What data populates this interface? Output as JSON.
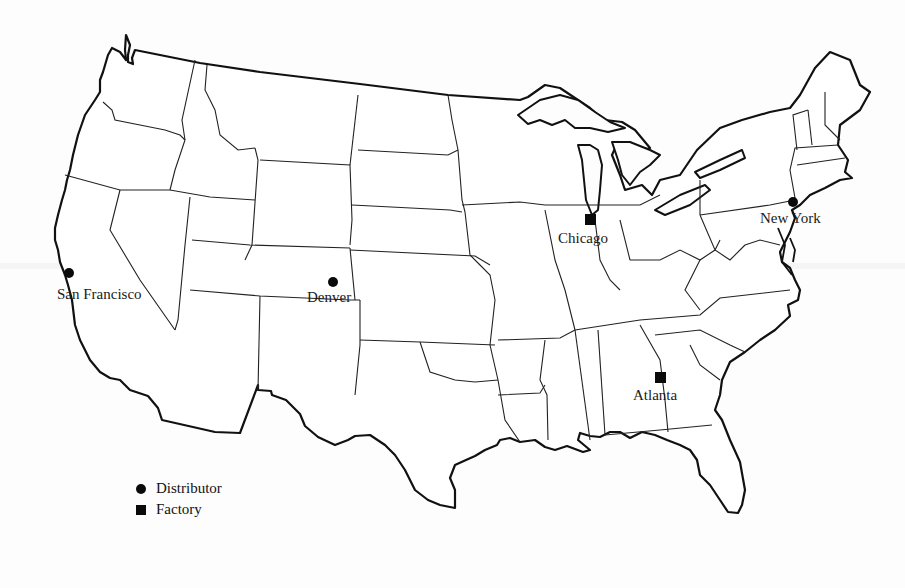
{
  "map": {
    "title": "United States distribution network",
    "region": "Contiguous United States (state outlines)"
  },
  "cities": [
    {
      "name": "San Francisco",
      "type": "distributor",
      "symbol": "circle",
      "x": 68,
      "y": 272
    },
    {
      "name": "Denver",
      "type": "distributor",
      "symbol": "circle",
      "x": 333,
      "y": 281
    },
    {
      "name": "Chicago",
      "type": "factory",
      "symbol": "square",
      "x": 590,
      "y": 219
    },
    {
      "name": "New York",
      "type": "distributor",
      "symbol": "circle",
      "x": 793,
      "y": 202
    },
    {
      "name": "Atlanta",
      "type": "factory",
      "symbol": "square",
      "x": 660,
      "y": 377
    }
  ],
  "legend": {
    "items": [
      {
        "symbol": "circle",
        "label": "Distributor"
      },
      {
        "symbol": "square",
        "label": "Factory"
      }
    ]
  },
  "colors": {
    "ink": "#111111",
    "background": "#fdfdfd"
  }
}
